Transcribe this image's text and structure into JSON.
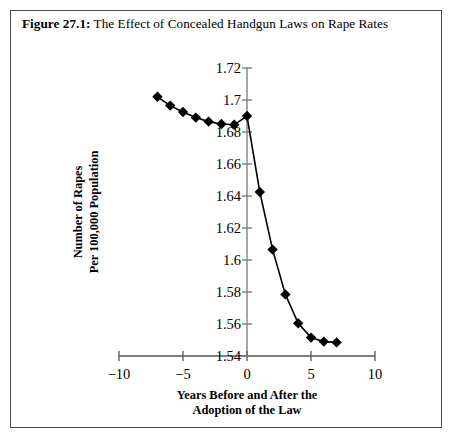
{
  "figure": {
    "number": "Figure 27.1:",
    "title": " The Effect of Concealed Handgun Laws on Rape Rates"
  },
  "chart_data": {
    "type": "line",
    "title": "Figure 27.1: The Effect of Concealed Handgun Laws on Rape Rates",
    "xlabel_line1": "Years Before and After the",
    "xlabel_line2": "Adoption of the Law",
    "ylabel_line1": "Number of Rapes",
    "ylabel_line2": "Per 100,000 Population",
    "x": [
      -7,
      -6,
      -5,
      -4,
      -3,
      -2,
      -1,
      0,
      1,
      2,
      3,
      4,
      5,
      6,
      7
    ],
    "values": [
      1.702,
      1.6965,
      1.6925,
      1.689,
      1.6865,
      1.685,
      1.6845,
      1.69,
      1.6425,
      1.6065,
      1.5785,
      1.5605,
      1.5515,
      1.549,
      1.5485
    ],
    "xlim": [
      -10,
      10
    ],
    "ylim": [
      1.54,
      1.72
    ],
    "xticks": [
      -10,
      -5,
      0,
      5,
      10
    ],
    "yticks": [
      1.54,
      1.56,
      1.58,
      1.6,
      1.62,
      1.64,
      1.66,
      1.68,
      1.7,
      1.72
    ],
    "xtick_labels": [
      "−10",
      "−5",
      "0",
      "5",
      "10"
    ],
    "ytick_labels": [
      "1.54",
      "1.56",
      "1.58",
      "1.6",
      "1.62",
      "1.64",
      "1.66",
      "1.68",
      "1.7",
      "1.72"
    ],
    "grid": false,
    "legend": null,
    "marker": "diamond",
    "line_color": "#000000",
    "marker_color": "#000000"
  }
}
